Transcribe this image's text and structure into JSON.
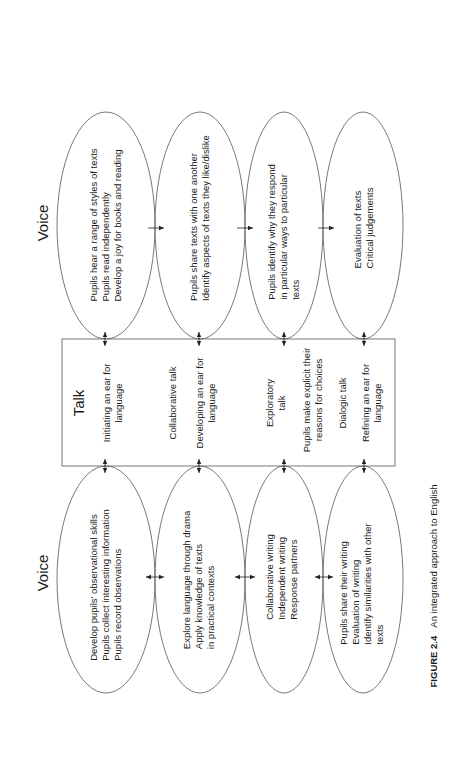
{
  "figure": {
    "label": "FIGURE 2.4",
    "title": "An integrated approach to English"
  },
  "top_section": {
    "heading": "Voice",
    "ellipses": [
      {
        "lines": [
          "Pupils hear a range of styles of texts",
          "Pupils read independently",
          "Develop a joy for books and reading"
        ]
      },
      {
        "lines": [
          "Pupils share texts with one another",
          "Identify aspects of texts they like/dislike"
        ]
      },
      {
        "lines": [
          "Pupils identify why they respond",
          "in particular ways to particular",
          "texts"
        ]
      },
      {
        "lines": [
          "Evaluation of texts",
          "Critical judgements"
        ]
      }
    ],
    "connector": "arrow-right"
  },
  "talk_box": {
    "heading": "Talk",
    "items": [
      {
        "lines": [
          "Initiating an ear for",
          "language"
        ]
      },
      {
        "lines": [
          "Collaborative talk"
        ]
      },
      {
        "lines": [
          "Developing an ear for",
          "language"
        ]
      },
      {
        "lines": [
          "Exploratory",
          "talk"
        ]
      },
      {
        "lines": [
          "Pupils make explicit their",
          "reasons for choices"
        ]
      },
      {
        "lines": [
          "Dialogic talk"
        ]
      },
      {
        "lines": [
          "Refining an ear for",
          "language"
        ]
      }
    ],
    "connector": "arrow-double-vertical"
  },
  "bottom_section": {
    "heading": "Voice",
    "ellipses": [
      {
        "lines": [
          "Develop pupils' observational skills",
          "Pupils collect interesting information",
          "Pupils record observations"
        ]
      },
      {
        "lines": [
          "Explore language through drama",
          "Apply knowledge of texts",
          "in practical contexts"
        ]
      },
      {
        "lines": [
          "Collaborative writing",
          "Independent writing",
          "Response partners"
        ]
      },
      {
        "lines": [
          "Pupils share their writing",
          "Evaluation of writing",
          "Identify similarities with other",
          "texts"
        ]
      }
    ],
    "connector": "arrow-double-horizontal"
  }
}
